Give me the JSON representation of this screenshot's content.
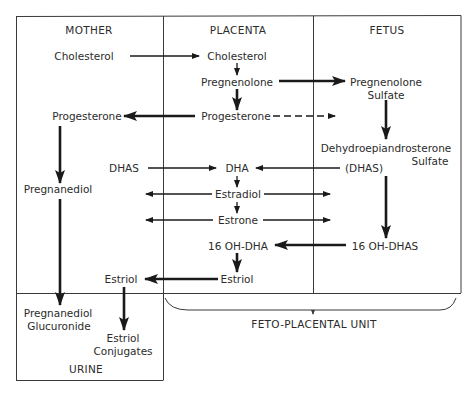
{
  "diagram": {
    "type": "steroid-biosynthesis-pathway",
    "compartments": {
      "mother": "MOTHER",
      "placenta": "PLACENTA",
      "fetus": "FETUS",
      "urine": "URINE",
      "feto_placental_unit": "FETO-PLACENTAL UNIT"
    },
    "nodes": {
      "mother_cholesterol": "Cholesterol",
      "placenta_cholesterol": "Cholesterol",
      "placenta_pregnenolone": "Pregnenolone",
      "fetus_pregnenolone_sulfate_1": "Pregnenolone",
      "fetus_pregnenolone_sulfate_2": "Sulfate",
      "mother_progesterone": "Progesterone",
      "placenta_progesterone": "Progesterone",
      "fetus_dheas_1": "Dehydroepiandrosterone",
      "fetus_dheas_2": "Sulfate",
      "fetus_dheas_abbr": "(DHAS)",
      "mother_dhas": "DHAS",
      "placenta_dha": "DHA",
      "mother_pregnanediol": "Pregnanediol",
      "placenta_estradiol": "Estradiol",
      "placenta_estrone": "Estrone",
      "placenta_16oh_dha": "16 OH-DHA",
      "fetus_16oh_dhas": "16 OH-DHAS",
      "placenta_estriol": "Estriol",
      "mother_estriol": "Estriol",
      "urine_pregnanediol_glucuronide_1": "Pregnanediol",
      "urine_pregnanediol_glucuronide_2": "Glucuronide",
      "urine_estriol_conjugates_1": "Estriol",
      "urine_estriol_conjugates_2": "Conjugates"
    },
    "edges": [
      {
        "from": "Cholesterol (Mother)",
        "to": "Cholesterol (Placenta)",
        "style": "thin"
      },
      {
        "from": "Cholesterol (Placenta)",
        "to": "Pregnenolone",
        "style": "thin"
      },
      {
        "from": "Pregnenolone",
        "to": "Pregnenolone Sulfate",
        "style": "bold"
      },
      {
        "from": "Pregnenolone",
        "to": "Progesterone (Placenta)",
        "style": "bold"
      },
      {
        "from": "Progesterone (Placenta)",
        "to": "Progesterone (Mother)",
        "style": "bold"
      },
      {
        "from": "Progesterone (Placenta)",
        "to": "Fetus",
        "style": "dashed"
      },
      {
        "from": "Pregnenolone Sulfate",
        "to": "DHAS (Fetus)",
        "style": "bold"
      },
      {
        "from": "DHAS (Fetus)",
        "to": "DHA",
        "style": "thin"
      },
      {
        "from": "DHAS (Mother)",
        "to": "DHA",
        "style": "thin"
      },
      {
        "from": "DHA",
        "to": "Estradiol",
        "style": "thin"
      },
      {
        "from": "Estradiol",
        "to": "Mother",
        "style": "thin"
      },
      {
        "from": "Estradiol",
        "to": "Fetus",
        "style": "thin"
      },
      {
        "from": "Estradiol",
        "to": "Estrone",
        "style": "thin"
      },
      {
        "from": "Estrone",
        "to": "Mother",
        "style": "thin"
      },
      {
        "from": "Estrone",
        "to": "Fetus",
        "style": "thin"
      },
      {
        "from": "DHAS (Fetus)",
        "to": "16 OH-DHAS",
        "style": "bold"
      },
      {
        "from": "16 OH-DHAS",
        "to": "16 OH-DHA",
        "style": "bold"
      },
      {
        "from": "16 OH-DHA",
        "to": "Estriol (Placenta)",
        "style": "bold"
      },
      {
        "from": "Estriol (Placenta)",
        "to": "Estriol (Mother)",
        "style": "bold"
      },
      {
        "from": "Estriol (Mother)",
        "to": "Estriol Conjugates",
        "style": "bold"
      },
      {
        "from": "Progesterone (Mother)",
        "to": "Pregnanediol",
        "style": "bold"
      },
      {
        "from": "Pregnanediol",
        "to": "Pregnanediol Glucuronide",
        "style": "bold"
      }
    ],
    "colors": {
      "ink": "#1a1a1a",
      "border": "#3a3a3a",
      "background": "#ffffff"
    }
  }
}
